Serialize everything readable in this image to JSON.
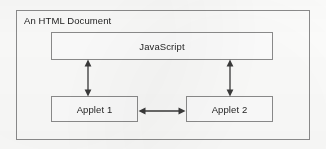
{
  "diagram": {
    "type": "block-diagram",
    "title": "An HTML Document",
    "colors": {
      "background": "#fdfdfc",
      "stroke": "#8c8c8c",
      "arrow": "#3a3a3a",
      "text": "#1f1f1f"
    },
    "nodes": [
      {
        "id": "javascript",
        "label": "JavaScript"
      },
      {
        "id": "applet1",
        "label": "Applet 1"
      },
      {
        "id": "applet2",
        "label": "Applet 2"
      }
    ],
    "connections": [
      {
        "id": "js-applet1",
        "from": "javascript",
        "to": "applet1",
        "arrowheads": "both",
        "orientation": "vertical"
      },
      {
        "id": "js-applet2",
        "from": "javascript",
        "to": "applet2",
        "arrowheads": "both",
        "orientation": "vertical"
      },
      {
        "id": "applet1-applet2",
        "from": "applet1",
        "to": "applet2",
        "arrowheads": "both",
        "orientation": "horizontal"
      }
    ]
  }
}
